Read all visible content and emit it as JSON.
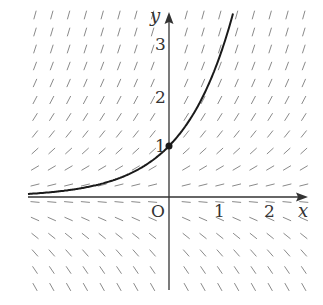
{
  "diagram": {
    "type": "slope_field",
    "equation": "dy/dx = y",
    "solution_curve": "y = e^x",
    "marked_point": {
      "x": 0,
      "y": 1
    },
    "axes": {
      "x_label": "x",
      "y_label": "y",
      "origin_label": "O",
      "x_ticks": [
        {
          "value": 1,
          "label": "1"
        },
        {
          "value": 2,
          "label": "2"
        }
      ],
      "y_ticks": [
        {
          "value": 1,
          "label": "1"
        },
        {
          "value": 2,
          "label": "2"
        },
        {
          "value": 3,
          "label": "3"
        }
      ]
    },
    "colors": {
      "axis": "#333333",
      "curve": "#1a1a1a",
      "slope_marks": "#8a8a8a",
      "background": "#ffffff"
    }
  }
}
